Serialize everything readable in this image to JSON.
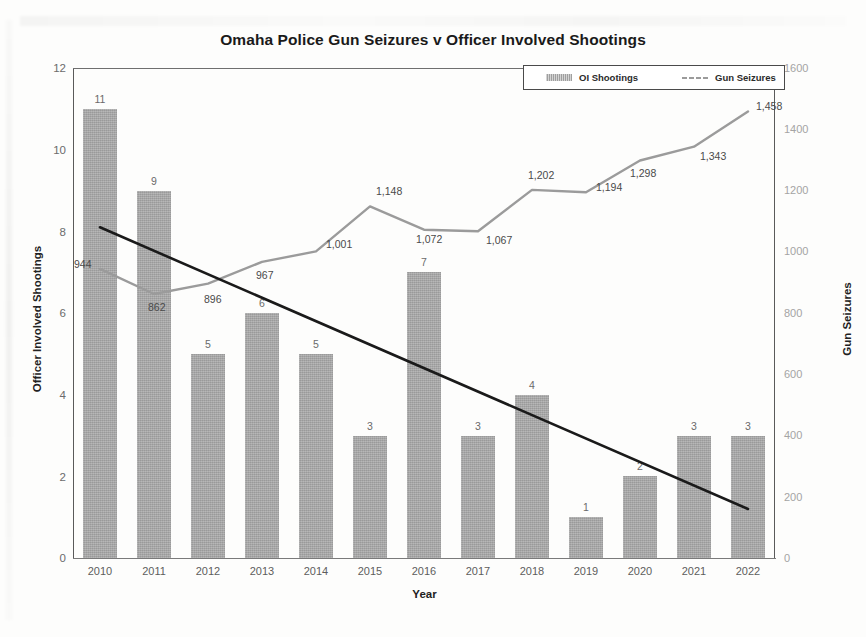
{
  "chart_data": {
    "type": "bar",
    "title": "Omaha Police Gun Seizures v Officer Involved Shootings",
    "xlabel": "Year",
    "ylabel": "Officer Involved Shootings",
    "y2label": "Gun Seizures",
    "categories": [
      "2010",
      "2011",
      "2012",
      "2013",
      "2014",
      "2015",
      "2016",
      "2017",
      "2018",
      "2019",
      "2020",
      "2021",
      "2022"
    ],
    "ylim": [
      0,
      12
    ],
    "y2lim": [
      0,
      1600
    ],
    "yticks": [
      "12",
      "10",
      "8",
      "6",
      "4",
      "2",
      "0"
    ],
    "y2ticks": [
      "1600",
      "1400",
      "1200",
      "1000",
      "800",
      "600",
      "400",
      "200",
      "0"
    ],
    "grid": false,
    "legend_position": "top-right",
    "series": [
      {
        "name": "OI Shootings",
        "type": "bar",
        "axis": "left",
        "color": "#a9a9a9",
        "values": [
          11,
          9,
          5,
          6,
          5,
          3,
          7,
          3,
          4,
          1,
          2,
          3,
          3
        ],
        "labels": [
          "11",
          "9",
          "5",
          "6",
          "5",
          "3",
          "7",
          "3",
          "4",
          "1",
          "2",
          "3",
          "3"
        ]
      },
      {
        "name": "Gun Seizures",
        "type": "line",
        "axis": "right",
        "color": "#9b9b9b",
        "values": [
          944,
          862,
          896,
          967,
          1001,
          1148,
          1072,
          1067,
          1202,
          1194,
          1298,
          1343,
          1458
        ],
        "labels": [
          "944",
          "862",
          "896",
          "967",
          "1,001",
          "1,148",
          "1,072",
          "1,067",
          "1,202",
          "1,194",
          "1,298",
          "1,343",
          "1,458"
        ]
      },
      {
        "name": "Trendline",
        "type": "line",
        "axis": "left",
        "color": "#1a1a1a",
        "annotation": "linear trend over OI Shootings",
        "endpoints": [
          [
            2010,
            8.1
          ],
          [
            2022,
            1.2
          ]
        ]
      }
    ]
  },
  "legend": {
    "items": [
      {
        "label": "OI Shootings",
        "swatch": "bar-swatch-icon"
      },
      {
        "label": "Gun Seizures",
        "swatch": "line-swatch-icon"
      }
    ]
  }
}
